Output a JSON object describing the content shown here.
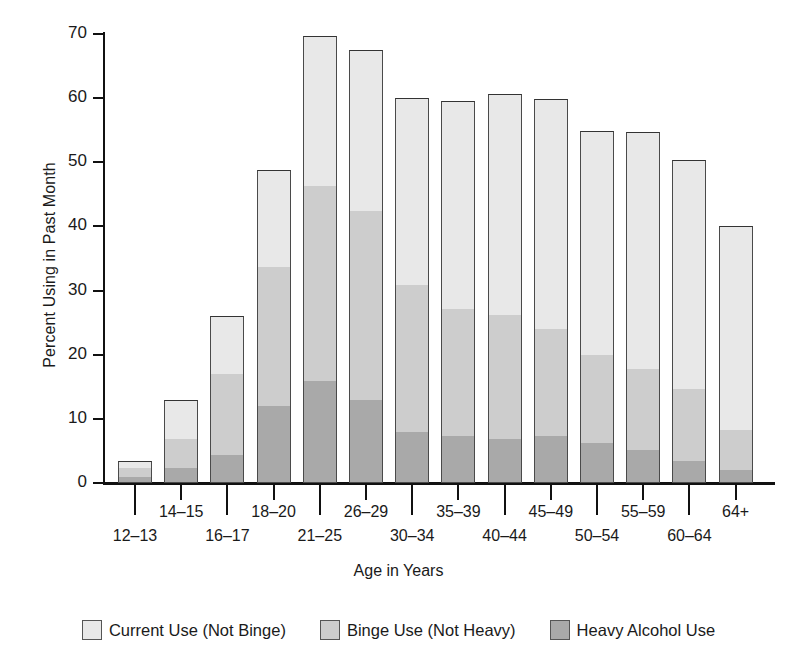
{
  "chart_data": {
    "type": "bar",
    "subtype": "stacked-bar",
    "title": "",
    "xlabel": "Age in Years",
    "ylabel": "Percent Using in Past Month",
    "ylim": [
      0,
      70
    ],
    "yticks": [
      0,
      10,
      20,
      30,
      40,
      50,
      60,
      70
    ],
    "ytick_labels": [
      "0",
      "10",
      "20",
      "30",
      "40",
      "50",
      "60",
      "70"
    ],
    "grid": false,
    "legend_position": "bottom",
    "categories": [
      "12–13",
      "14–15",
      "16–17",
      "18–20",
      "21–25",
      "26–29",
      "30–34",
      "35–39",
      "40–44",
      "45–49",
      "50–54",
      "55–59",
      "60–64",
      "64+"
    ],
    "series": [
      {
        "name": "Heavy Alcohol Use",
        "color": "#a9a9a9",
        "values": [
          1.0,
          2.4,
          4.3,
          12.0,
          15.9,
          13.0,
          8.0,
          7.3,
          6.8,
          7.3,
          6.2,
          5.2,
          3.4,
          2.0
        ]
      },
      {
        "name": "Binge Use (Not Heavy)",
        "color": "#cdcdcd",
        "values": [
          1.3,
          4.4,
          12.7,
          21.7,
          30.4,
          29.4,
          22.8,
          19.9,
          19.4,
          16.7,
          13.8,
          12.5,
          11.2,
          6.2
        ]
      },
      {
        "name": "Current Use (Not Binge)",
        "color": "#e8e8e8",
        "values": [
          1.1,
          6.2,
          9.0,
          15.1,
          23.4,
          25.1,
          29.2,
          32.4,
          34.4,
          35.9,
          34.9,
          37.1,
          35.8,
          31.8
        ]
      }
    ],
    "totals": [
      3.4,
      13.0,
      26.0,
      48.8,
      69.7,
      67.5,
      60.0,
      59.6,
      60.6,
      59.9,
      54.9,
      54.8,
      50.4,
      40.0
    ],
    "segment_tops": {
      "heavy": [
        1.0,
        2.4,
        4.3,
        12.0,
        15.9,
        13.0,
        8.0,
        7.3,
        6.8,
        7.3,
        6.2,
        5.2,
        3.4,
        2.0
      ],
      "heavy_plus_binge": [
        2.3,
        6.8,
        17.0,
        33.7,
        46.3,
        42.4,
        30.8,
        27.2,
        26.2,
        24.0,
        20.0,
        17.7,
        14.6,
        8.2
      ],
      "total": [
        3.4,
        13.0,
        26.0,
        48.8,
        69.7,
        67.5,
        60.0,
        59.6,
        60.6,
        59.9,
        54.9,
        54.8,
        50.4,
        40.0
      ]
    },
    "legend": [
      {
        "label": "Current Use (Not Binge)",
        "color": "#e8e8e8"
      },
      {
        "label": "Binge Use (Not Heavy)",
        "color": "#cdcdcd"
      },
      {
        "label": "Heavy Alcohol Use",
        "color": "#a9a9a9"
      }
    ]
  },
  "axis": {
    "y_title": "Percent Using in Past Month",
    "x_title": "Age in Years"
  }
}
